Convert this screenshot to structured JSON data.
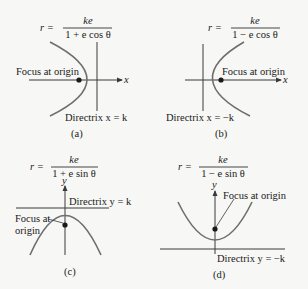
{
  "figure": {
    "colors": {
      "background": "#f7f7f5",
      "text": "#1a1a1a",
      "axis": "#3a3a3a",
      "curve": "#6e6e6e"
    },
    "panels": [
      {
        "caption": "(a)",
        "formula": {
          "lhs": "r =",
          "numerator": "ke",
          "denominator": "1 + e cos θ"
        },
        "axis_label": "x",
        "focus_label": "Focus at origin",
        "directrix_label": "Directrix x = k",
        "opens": "left"
      },
      {
        "caption": "(b)",
        "formula": {
          "lhs": "r =",
          "numerator": "ke",
          "denominator": "1 − e cos θ"
        },
        "axis_label": "x",
        "focus_label": "Focus at origin",
        "directrix_label": "Directrix x = −k",
        "opens": "right"
      },
      {
        "caption": "(c)",
        "formula": {
          "lhs": "r =",
          "numerator": "ke",
          "denominator": "1 + e sin θ"
        },
        "axis_label": "y",
        "focus_label_line1": "Focus at",
        "focus_label_line2": "origin",
        "directrix_label": "Directrix y = k",
        "opens": "down"
      },
      {
        "caption": "(d)",
        "formula": {
          "lhs": "r =",
          "numerator": "ke",
          "denominator": "1 − e sin θ"
        },
        "axis_label": "y",
        "focus_label": "Focus at origin",
        "directrix_label": "Directrix y = −k",
        "opens": "up"
      }
    ]
  }
}
